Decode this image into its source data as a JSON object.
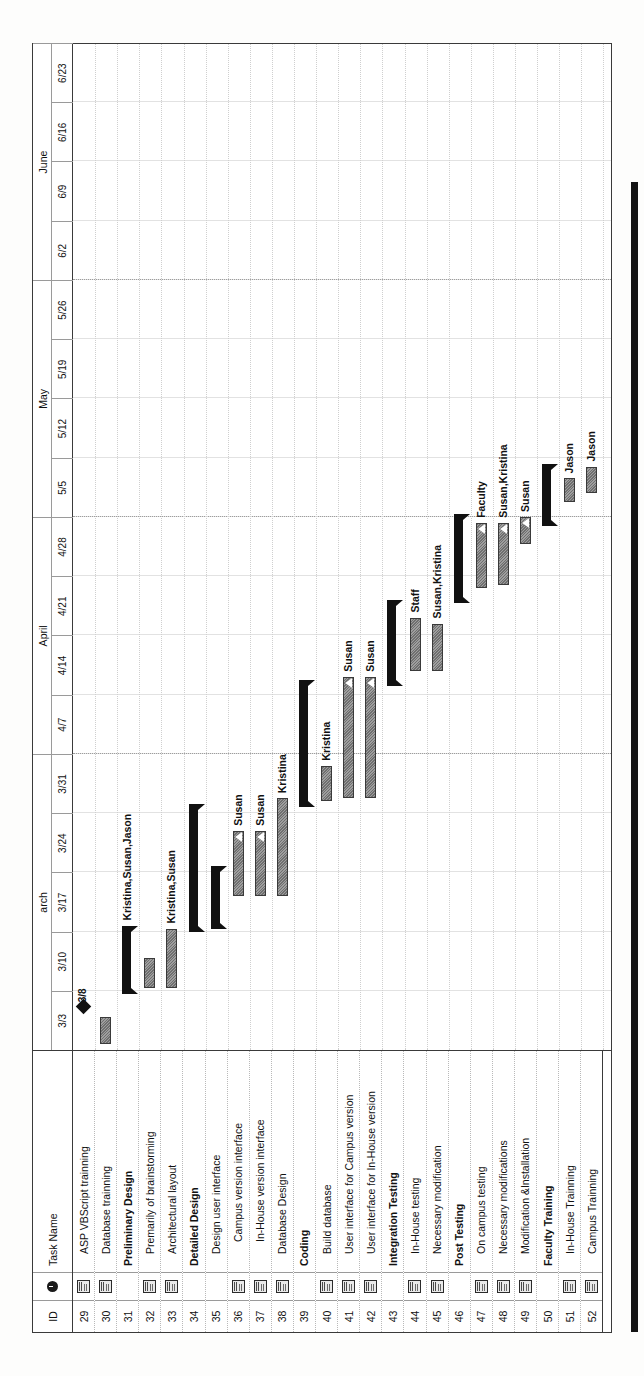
{
  "app": {
    "view": "Gantt Chart"
  },
  "table": {
    "headers": {
      "id": "ID",
      "indicator": "i",
      "name": "Task Name"
    },
    "rows": [
      {
        "id": "29",
        "name": "ASP VBScript trainning",
        "level": 2,
        "note": true
      },
      {
        "id": "30",
        "name": "Database trainning",
        "level": 2,
        "note": true
      },
      {
        "id": "31",
        "name": "Preliminary Design",
        "level": 1,
        "note": false
      },
      {
        "id": "32",
        "name": "Premarily of brainstorming",
        "level": 2,
        "note": true
      },
      {
        "id": "33",
        "name": "Architectural layout",
        "level": 2,
        "note": true
      },
      {
        "id": "34",
        "name": "Detailed Design",
        "level": 1,
        "note": false
      },
      {
        "id": "35",
        "name": "Design user interface",
        "level": 2,
        "note": false
      },
      {
        "id": "36",
        "name": "Campus version interface",
        "level": 3,
        "note": true
      },
      {
        "id": "37",
        "name": "In-House version interface",
        "level": 3,
        "note": true
      },
      {
        "id": "38",
        "name": "Database Design",
        "level": 2,
        "note": true
      },
      {
        "id": "39",
        "name": "Coding",
        "level": 1,
        "note": false
      },
      {
        "id": "40",
        "name": "Build database",
        "level": 2,
        "note": true
      },
      {
        "id": "41",
        "name": "User interface for Campus version",
        "level": 2,
        "note": true
      },
      {
        "id": "42",
        "name": "User interface for In-House version",
        "level": 2,
        "note": true
      },
      {
        "id": "43",
        "name": "Integration Testing",
        "level": 1,
        "note": false
      },
      {
        "id": "44",
        "name": "In-House testing",
        "level": 2,
        "note": true
      },
      {
        "id": "45",
        "name": "Necessary modification",
        "level": 2,
        "note": true
      },
      {
        "id": "46",
        "name": "Post Testing",
        "level": 1,
        "note": false
      },
      {
        "id": "47",
        "name": "On campus testing",
        "level": 2,
        "note": true
      },
      {
        "id": "48",
        "name": "Necessary modifications",
        "level": 2,
        "note": true
      },
      {
        "id": "49",
        "name": "Modification &Installation",
        "level": 2,
        "note": true
      },
      {
        "id": "50",
        "name": "Faculty Training",
        "level": 1,
        "note": false
      },
      {
        "id": "51",
        "name": "In-House Trainning",
        "level": 2,
        "note": true
      },
      {
        "id": "52",
        "name": "Campus Trainning",
        "level": 2,
        "note": true
      }
    ]
  },
  "timeline": {
    "months": [
      {
        "label": "arch",
        "start_week": 0,
        "span": 5
      },
      {
        "label": "April",
        "start_week": 5,
        "span": 4
      },
      {
        "label": "May",
        "start_week": 9,
        "span": 4
      },
      {
        "label": "June",
        "start_week": 13,
        "span": 4
      }
    ],
    "weeks": [
      "3/3",
      "3/10",
      "3/17",
      "3/24",
      "3/31",
      "4/7",
      "4/14",
      "4/21",
      "4/28",
      "5/5",
      "5/12",
      "5/19",
      "5/26",
      "6/2",
      "6/9",
      "6/16",
      "6/23"
    ],
    "month_separators": [
      5,
      9,
      13
    ]
  },
  "chart_data": {
    "type": "bar",
    "xlabel": "Week beginning",
    "ylabel": "Task",
    "x": [
      "3/3",
      "3/10",
      "3/17",
      "3/24",
      "3/31",
      "4/7",
      "4/14",
      "4/21",
      "4/28",
      "5/5",
      "5/12",
      "5/19",
      "5/26",
      "6/2",
      "6/9",
      "6/16",
      "6/23"
    ],
    "xlim": [
      "3/3",
      "6/23"
    ],
    "grid": true,
    "legend": "none",
    "bars": [
      {
        "id": "29",
        "kind": "milestone",
        "start": 0.72,
        "end": 0.72,
        "label": "3/8",
        "resources": ""
      },
      {
        "id": "30",
        "kind": "task",
        "start": 0.1,
        "end": 0.55,
        "label": "",
        "resources": ""
      },
      {
        "id": "31",
        "kind": "summary",
        "start": 0.95,
        "end": 2.1,
        "label": "Kristina,Susan,Jason",
        "resources": "Kristina,Susan,Jason"
      },
      {
        "id": "32",
        "kind": "task",
        "start": 1.05,
        "end": 1.55,
        "label": "",
        "resources": ""
      },
      {
        "id": "33",
        "kind": "task",
        "start": 1.05,
        "end": 2.05,
        "label": "Kristina,Susan",
        "resources": "Kristina,Susan"
      },
      {
        "id": "34",
        "kind": "summary",
        "start": 2.0,
        "end": 4.15,
        "label": "",
        "resources": ""
      },
      {
        "id": "35",
        "kind": "summary",
        "start": 2.05,
        "end": 3.1,
        "label": "",
        "resources": ""
      },
      {
        "id": "36",
        "kind": "task",
        "start": 2.6,
        "end": 3.7,
        "label": "Susan",
        "resources": "Susan",
        "progress_arrow": true
      },
      {
        "id": "37",
        "kind": "task",
        "start": 2.6,
        "end": 3.7,
        "label": "Susan",
        "resources": "Susan",
        "progress_arrow": true
      },
      {
        "id": "38",
        "kind": "task",
        "start": 2.6,
        "end": 4.25,
        "label": "Kristina",
        "resources": "Kristina"
      },
      {
        "id": "39",
        "kind": "summary",
        "start": 4.1,
        "end": 6.25,
        "label": "",
        "resources": ""
      },
      {
        "id": "40",
        "kind": "task",
        "start": 4.2,
        "end": 4.8,
        "label": "Kristina",
        "resources": "Kristina"
      },
      {
        "id": "41",
        "kind": "task",
        "start": 4.25,
        "end": 6.3,
        "label": "Susan",
        "resources": "Susan",
        "progress_arrow": true
      },
      {
        "id": "42",
        "kind": "task",
        "start": 4.25,
        "end": 6.3,
        "label": "Susan",
        "resources": "Susan",
        "progress_arrow": true
      },
      {
        "id": "43",
        "kind": "summary",
        "start": 6.15,
        "end": 7.6,
        "label": "",
        "resources": ""
      },
      {
        "id": "44",
        "kind": "task",
        "start": 6.4,
        "end": 7.3,
        "label": "Staff",
        "resources": "Staff"
      },
      {
        "id": "45",
        "kind": "task",
        "start": 6.4,
        "end": 7.2,
        "label": "Susan,Kristina",
        "resources": "Susan,Kristina"
      },
      {
        "id": "46",
        "kind": "summary",
        "start": 7.55,
        "end": 9.05,
        "label": "",
        "resources": ""
      },
      {
        "id": "47",
        "kind": "task",
        "start": 7.8,
        "end": 8.9,
        "label": "Faculty",
        "resources": "Faculty",
        "progress_arrow": true
      },
      {
        "id": "48",
        "kind": "task",
        "start": 7.85,
        "end": 8.9,
        "label": "Susan,Kristina",
        "resources": "Susan,Kristina",
        "progress_arrow": true
      },
      {
        "id": "49",
        "kind": "task",
        "start": 8.55,
        "end": 9.0,
        "label": "Susan",
        "resources": "Susan",
        "progress_arrow": true
      },
      {
        "id": "50",
        "kind": "summary",
        "start": 8.85,
        "end": 9.9,
        "label": "",
        "resources": ""
      },
      {
        "id": "51",
        "kind": "task",
        "start": 9.25,
        "end": 9.65,
        "label": "Jason",
        "resources": "Jason"
      },
      {
        "id": "52",
        "kind": "task",
        "start": 9.4,
        "end": 9.85,
        "label": "Jason",
        "resources": "Jason"
      }
    ]
  }
}
